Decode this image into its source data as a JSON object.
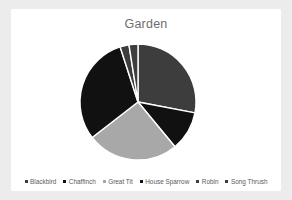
{
  "card": {
    "background": "#ffffff",
    "page_background": "#ececed"
  },
  "chart_data": {
    "type": "pie",
    "title": "Garden",
    "xlabel": "",
    "ylabel": "",
    "grid": false,
    "legend_position": "bottom",
    "start_angle_deg": 0,
    "direction": "clockwise",
    "center": [
      138,
      102
    ],
    "radius": 58,
    "categories": [
      "Blackbird",
      "Chaffinch",
      "Great Tit",
      "House Sparrow",
      "Robin",
      "Song Thrush"
    ],
    "values": [
      28,
      11,
      25.5,
      30.5,
      2.5,
      2.5
    ],
    "colors": [
      "#3d3d3d",
      "#111111",
      "#a8a8a8",
      "#111111",
      "#3d3d3d",
      "#3d3d3d"
    ],
    "slices": [
      {
        "label": "Blackbird",
        "value": 28,
        "color": "#3d3d3d",
        "start_deg": 0,
        "end_deg": 100.8
      },
      {
        "label": "Chaffinch",
        "value": 11,
        "color": "#111111",
        "start_deg": 100.8,
        "end_deg": 140.4
      },
      {
        "label": "Great Tit",
        "value": 25.5,
        "color": "#a8a8a8",
        "start_deg": 140.4,
        "end_deg": 232.2
      },
      {
        "label": "House Sparrow",
        "value": 30.5,
        "color": "#111111",
        "start_deg": 232.2,
        "end_deg": 342.0
      },
      {
        "label": "Robin",
        "value": 2.5,
        "color": "#3d3d3d",
        "start_deg": 342.0,
        "end_deg": 351.0
      },
      {
        "label": "Song Thrush",
        "value": 2.5,
        "color": "#3d3d3d",
        "start_deg": 351.0,
        "end_deg": 360.0
      }
    ]
  },
  "legend": {
    "items": [
      {
        "label": "Blackbird",
        "color": "#3d3d3d"
      },
      {
        "label": "Chaffinch",
        "color": "#111111"
      },
      {
        "label": "Great Tit",
        "color": "#a8a8a8"
      },
      {
        "label": "House Sparrow",
        "color": "#111111"
      },
      {
        "label": "Robin",
        "color": "#3d3d3d"
      },
      {
        "label": "Song Thrush",
        "color": "#3d3d3d"
      }
    ]
  }
}
